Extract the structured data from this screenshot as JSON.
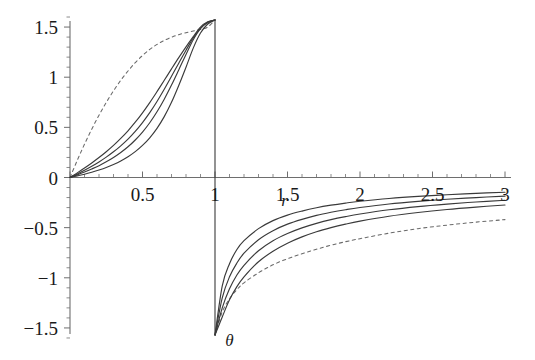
{
  "chart_data": {
    "type": "line",
    "title": "",
    "xlabel": "r",
    "ylabel": "θ",
    "xlim": [
      0,
      3
    ],
    "ylim": [
      -1.6,
      1.6
    ],
    "grid": false,
    "legend": "none",
    "background_color": "#ffffff",
    "axis_color": "#6e6e6e",
    "curve_color": "#3a3a3a",
    "dashed_color": "#6a6a6a",
    "x_ticks": [
      {
        "value": 0.5,
        "label": "0.5"
      },
      {
        "value": 1,
        "label": "1"
      },
      {
        "value": 1.5,
        "label": "1.5"
      },
      {
        "value": 2,
        "label": "2"
      },
      {
        "value": 2.5,
        "label": "2.5"
      },
      {
        "value": 3,
        "label": "3"
      }
    ],
    "y_ticks": [
      {
        "value": 1.5,
        "label": "1.5"
      },
      {
        "value": 1,
        "label": "1"
      },
      {
        "value": 0.5,
        "label": "0.5"
      },
      {
        "value": 0,
        "label": "0"
      },
      {
        "value": -0.5,
        "label": "−0.5"
      },
      {
        "value": -1,
        "label": "−1"
      },
      {
        "value": -1.5,
        "label": "−1.5"
      }
    ],
    "x_minor_tick_step": 0.1,
    "y_minor_tick_step": 0.1,
    "annotations": [
      {
        "name": "r-axis-annotation",
        "text": "r",
        "x": 1.48,
        "y": -0.22
      },
      {
        "name": "theta-axis-annotation",
        "text": "θ",
        "x": 1.1,
        "y": -1.62
      }
    ],
    "asymptote_y_top": 1.5708,
    "asymptote_y_bottom": -1.5708,
    "series": [
      {
        "name": "branch-a-dashed",
        "style": "dashed",
        "branch": "upper",
        "x": [
          0,
          0.05,
          0.1,
          0.15,
          0.2,
          0.25,
          0.3,
          0.35,
          0.4,
          0.45,
          0.5,
          0.55,
          0.6,
          0.65,
          0.7,
          0.75,
          0.8,
          0.85,
          0.9,
          0.95,
          1.0
        ],
        "y": [
          0,
          0.171,
          0.332,
          0.482,
          0.621,
          0.748,
          0.864,
          0.969,
          1.062,
          1.145,
          1.216,
          1.277,
          1.327,
          1.367,
          1.399,
          1.424,
          1.444,
          1.46,
          1.476,
          1.5,
          1.5708
        ]
      },
      {
        "name": "branch-b-solid",
        "style": "solid",
        "branch": "upper",
        "x": [
          0,
          0.05,
          0.1,
          0.15,
          0.2,
          0.25,
          0.3,
          0.35,
          0.4,
          0.45,
          0.5,
          0.55,
          0.6,
          0.65,
          0.7,
          0.75,
          0.8,
          0.85,
          0.9,
          0.95,
          1.0
        ],
        "y": [
          0,
          0.046,
          0.094,
          0.145,
          0.199,
          0.257,
          0.32,
          0.39,
          0.466,
          0.551,
          0.645,
          0.747,
          0.856,
          0.969,
          1.083,
          1.195,
          1.303,
          1.405,
          1.5,
          1.552,
          1.5708
        ]
      },
      {
        "name": "branch-c-solid",
        "style": "solid",
        "branch": "upper",
        "x": [
          0,
          0.05,
          0.1,
          0.15,
          0.2,
          0.25,
          0.3,
          0.35,
          0.4,
          0.45,
          0.5,
          0.55,
          0.6,
          0.65,
          0.7,
          0.75,
          0.8,
          0.85,
          0.9,
          0.95,
          1.0
        ],
        "y": [
          0,
          0.035,
          0.072,
          0.112,
          0.155,
          0.203,
          0.256,
          0.316,
          0.383,
          0.46,
          0.548,
          0.647,
          0.758,
          0.88,
          1.009,
          1.14,
          1.269,
          1.392,
          1.49,
          1.548,
          1.5708
        ]
      },
      {
        "name": "branch-d-solid",
        "style": "solid",
        "branch": "upper",
        "x": [
          0,
          0.05,
          0.1,
          0.15,
          0.2,
          0.25,
          0.3,
          0.35,
          0.4,
          0.45,
          0.5,
          0.55,
          0.6,
          0.65,
          0.7,
          0.75,
          0.8,
          0.85,
          0.9,
          0.95,
          1.0
        ],
        "y": [
          0,
          0.026,
          0.054,
          0.085,
          0.118,
          0.156,
          0.199,
          0.249,
          0.306,
          0.374,
          0.453,
          0.546,
          0.655,
          0.781,
          0.922,
          1.073,
          1.227,
          1.374,
          1.485,
          1.545,
          1.5708
        ]
      },
      {
        "name": "branch-e-solid",
        "style": "solid",
        "branch": "upper",
        "x": [
          0,
          0.05,
          0.1,
          0.15,
          0.2,
          0.25,
          0.3,
          0.35,
          0.4,
          0.45,
          0.5,
          0.55,
          0.6,
          0.65,
          0.7,
          0.75,
          0.8,
          0.85,
          0.9,
          0.95,
          1.0
        ],
        "y": [
          0,
          0.016,
          0.033,
          0.053,
          0.075,
          0.1,
          0.13,
          0.165,
          0.207,
          0.258,
          0.32,
          0.396,
          0.49,
          0.607,
          0.75,
          0.918,
          1.1,
          1.29,
          1.44,
          1.53,
          1.5708
        ]
      },
      {
        "name": "branch-a-dashed-lower",
        "style": "dashed",
        "branch": "lower",
        "x": [
          1.0,
          1.05,
          1.1,
          1.15,
          1.2,
          1.3,
          1.4,
          1.5,
          1.6,
          1.7,
          1.8,
          1.9,
          2.0,
          2.2,
          2.4,
          2.6,
          2.8,
          3.0
        ],
        "y": [
          -1.5708,
          -1.34,
          -1.21,
          -1.12,
          -1.05,
          -0.95,
          -0.87,
          -0.81,
          -0.76,
          -0.715,
          -0.675,
          -0.64,
          -0.61,
          -0.555,
          -0.51,
          -0.475,
          -0.445,
          -0.42
        ]
      },
      {
        "name": "branch-b-solid-lower",
        "style": "solid",
        "branch": "lower",
        "x": [
          1.0,
          1.05,
          1.1,
          1.15,
          1.2,
          1.3,
          1.4,
          1.5,
          1.6,
          1.7,
          1.8,
          1.9,
          2.0,
          2.2,
          2.4,
          2.6,
          2.8,
          3.0
        ],
        "y": [
          -1.5708,
          -1.08,
          -0.86,
          -0.72,
          -0.63,
          -0.51,
          -0.43,
          -0.375,
          -0.335,
          -0.302,
          -0.276,
          -0.255,
          -0.237,
          -0.209,
          -0.188,
          -0.172,
          -0.158,
          -0.147
        ]
      },
      {
        "name": "branch-c-solid-lower",
        "style": "solid",
        "branch": "lower",
        "x": [
          1.0,
          1.05,
          1.1,
          1.15,
          1.2,
          1.3,
          1.4,
          1.5,
          1.6,
          1.7,
          1.8,
          1.9,
          2.0,
          2.2,
          2.4,
          2.6,
          2.8,
          3.0
        ],
        "y": [
          -1.5708,
          -1.2,
          -0.99,
          -0.855,
          -0.755,
          -0.62,
          -0.53,
          -0.465,
          -0.417,
          -0.378,
          -0.347,
          -0.321,
          -0.299,
          -0.264,
          -0.238,
          -0.217,
          -0.2,
          -0.186
        ]
      },
      {
        "name": "branch-d-solid-lower",
        "style": "solid",
        "branch": "lower",
        "x": [
          1.0,
          1.05,
          1.1,
          1.15,
          1.2,
          1.3,
          1.4,
          1.5,
          1.6,
          1.7,
          1.8,
          1.9,
          2.0,
          2.2,
          2.4,
          2.6,
          2.8,
          3.0
        ],
        "y": [
          -1.5708,
          -1.3,
          -1.11,
          -0.975,
          -0.875,
          -0.73,
          -0.63,
          -0.558,
          -0.502,
          -0.457,
          -0.42,
          -0.39,
          -0.364,
          -0.322,
          -0.29,
          -0.265,
          -0.244,
          -0.227
        ]
      },
      {
        "name": "branch-e-solid-lower",
        "style": "solid",
        "branch": "lower",
        "x": [
          1.0,
          1.05,
          1.1,
          1.15,
          1.2,
          1.3,
          1.4,
          1.5,
          1.6,
          1.7,
          1.8,
          1.9,
          2.0,
          2.2,
          2.4,
          2.6,
          2.8,
          3.0
        ],
        "y": [
          -1.5708,
          -1.39,
          -1.22,
          -1.09,
          -0.99,
          -0.84,
          -0.735,
          -0.655,
          -0.592,
          -0.541,
          -0.5,
          -0.465,
          -0.435,
          -0.386,
          -0.349,
          -0.319,
          -0.295,
          -0.274
        ]
      }
    ],
    "vertical_segment": {
      "name": "vertical-asymptote-at-r-1",
      "x": 1.0,
      "y_from": 1.5708,
      "y_to": -1.5708
    }
  }
}
